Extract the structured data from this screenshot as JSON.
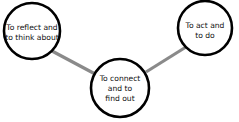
{
  "diagram": {
    "colors": {
      "circle_stroke": "#000000",
      "circle_fill": "#ffffff",
      "connector": "#8a8a8a",
      "text": "#111111"
    },
    "nodes": [
      {
        "id": "reflect",
        "lines": [
          "To reflect and",
          "to think about"
        ]
      },
      {
        "id": "act",
        "lines": [
          "To act and",
          "to do"
        ]
      },
      {
        "id": "connect",
        "lines": [
          "To connect",
          "and to",
          "find out"
        ]
      }
    ],
    "edges": [
      {
        "from": "reflect",
        "to": "connect"
      },
      {
        "from": "connect",
        "to": "act"
      }
    ]
  }
}
